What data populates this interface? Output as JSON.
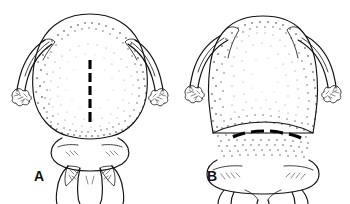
{
  "figure": {
    "kind": "scientific-line-illustration",
    "background_color": "#ffffff",
    "ink_color": "#111111",
    "width": 350,
    "height": 204,
    "panels": [
      {
        "id": "A",
        "label": "A",
        "label_x": 34,
        "label_y": 181,
        "description": "Dorsal view of head capsule, rounded-oval, with paired lateral antennae and a vertical dashed median line",
        "guide_line": {
          "orientation": "vertical",
          "dash_count": 6,
          "x": 90,
          "y_start": 60,
          "y_end": 122
        }
      },
      {
        "id": "B",
        "label": "B",
        "label_x": 207,
        "label_y": 181,
        "description": "Dorsal view of head capsule, broader and more trapezoidal, with paired lateral antennae and a transverse curved dashed line near the base",
        "guide_line": {
          "orientation": "horizontal-curved",
          "dash_count": 5,
          "x_start": 233,
          "x_end": 305,
          "y": 133
        }
      }
    ]
  }
}
